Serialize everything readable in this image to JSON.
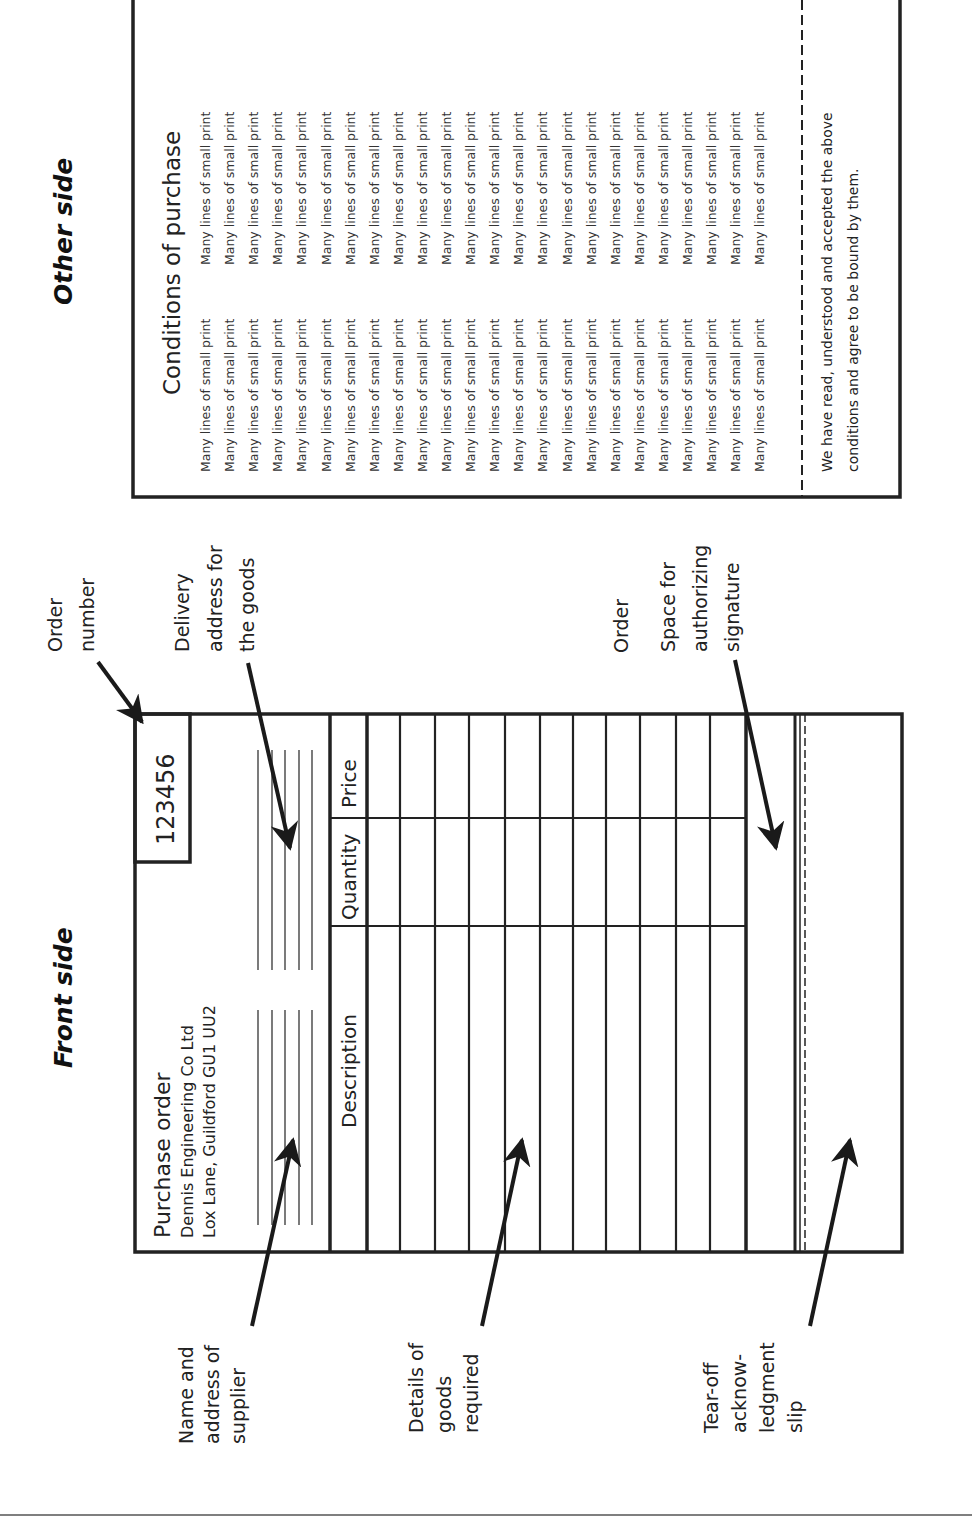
{
  "titles": {
    "front": "Front side",
    "other": "Other side"
  },
  "front_form": {
    "order_number": "123456",
    "heading": "Purchase order",
    "supplier_name": "Dennis Engineering Co Ltd",
    "supplier_address": "Lox Lane, Guildford GU1 UU2",
    "columns": [
      "Description",
      "Quantity",
      "Price"
    ],
    "row_count": 11
  },
  "callouts": {
    "order_number": [
      "Order",
      "number"
    ],
    "delivery": [
      "Delivery",
      "address for",
      "the goods"
    ],
    "signature": [
      "Space for",
      "authorizing",
      "signature"
    ],
    "supplier": [
      "Name and",
      "address of",
      "supplier"
    ],
    "goods": [
      "Details of",
      "goods",
      "required"
    ],
    "tearoff": [
      "Tear-off",
      "acknow-",
      "ledgment",
      "slip"
    ]
  },
  "other_form": {
    "heading": "Conditions of purchase",
    "small_print_line": "Many lines of small print",
    "small_print_rows": 24,
    "small_print_columns": 2,
    "acceptance": [
      "We have read, understood and accepted the above",
      "conditions and agree to be bound by them."
    ]
  },
  "colors": {
    "ink": "#222222",
    "background": "#ffffff"
  }
}
